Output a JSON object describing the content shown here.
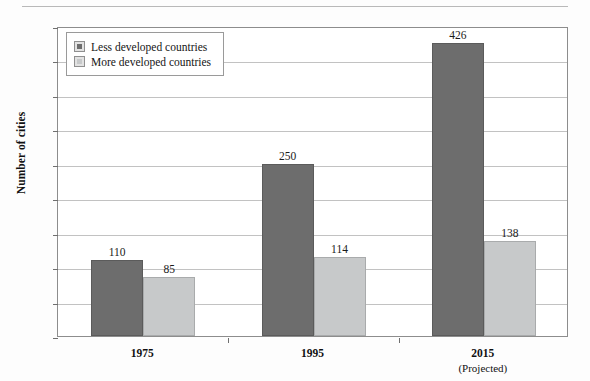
{
  "chart_data": {
    "type": "bar",
    "title": "",
    "xlabel": "",
    "ylabel": "Number of cities",
    "categories": [
      "1975",
      "1995",
      "2015"
    ],
    "category_sublabels": [
      "",
      "",
      "(Projected)"
    ],
    "series": [
      {
        "name": "Less developed countries",
        "values": [
          110,
          250,
          426
        ],
        "color": "#6d6d6d"
      },
      {
        "name": "More developed countries",
        "values": [
          85,
          114,
          138
        ],
        "color": "#c7c9ca"
      }
    ],
    "ylim": [
      0,
      450
    ],
    "ytick_step": 50,
    "yticks": [
      0,
      50,
      100,
      150,
      200,
      250,
      300,
      350,
      400,
      450
    ],
    "ytick_labels": [
      "0",
      "50",
      "100",
      "150",
      "200",
      "250",
      "300",
      "350",
      "400",
      "450"
    ],
    "grid": true,
    "legend_position": "top-left",
    "data_labels": true
  },
  "legend": {
    "items": [
      {
        "label": "Less developed countries",
        "swatch": "dark"
      },
      {
        "label": "More developed countries",
        "swatch": "light"
      }
    ]
  }
}
